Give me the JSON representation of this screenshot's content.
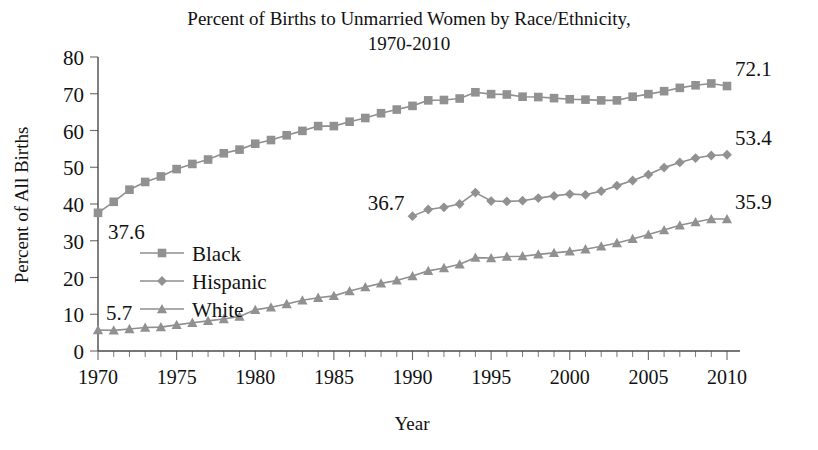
{
  "chart_data": {
    "type": "line",
    "title": "Percent of Births to Unmarried Women by Race/Ethnicity,",
    "title_line2": "1970-2010",
    "xlabel": "Year",
    "ylabel": "Percent of All Births",
    "xlim": [
      1970,
      2010
    ],
    "ylim": [
      0,
      80
    ],
    "ytick_step": 10,
    "xtick_step": 5,
    "xtick_minor_step": 1,
    "grid": false,
    "legend_position": "inside-left",
    "yticks": [
      "0",
      "10",
      "20",
      "30",
      "40",
      "50",
      "60",
      "70",
      "80"
    ],
    "xticks": [
      "1970",
      "1975",
      "1980",
      "1985",
      "1990",
      "1995",
      "2000",
      "2005",
      "2010"
    ],
    "series": [
      {
        "name": "Black",
        "marker": "square",
        "color": "#919191",
        "x": [
          1970,
          1971,
          1972,
          1973,
          1974,
          1975,
          1976,
          1977,
          1978,
          1979,
          1980,
          1981,
          1982,
          1983,
          1984,
          1985,
          1986,
          1987,
          1988,
          1989,
          1990,
          1991,
          1992,
          1993,
          1994,
          1995,
          1996,
          1997,
          1998,
          1999,
          2000,
          2001,
          2002,
          2003,
          2004,
          2005,
          2006,
          2007,
          2008,
          2009,
          2010
        ],
        "values": [
          37.6,
          40.6,
          43.9,
          46.0,
          47.5,
          49.5,
          50.9,
          52.1,
          53.8,
          54.8,
          56.4,
          57.4,
          58.7,
          59.9,
          61.2,
          61.2,
          62.4,
          63.4,
          64.7,
          65.7,
          66.7,
          68.2,
          68.3,
          68.7,
          70.4,
          69.9,
          69.8,
          69.2,
          69.1,
          68.8,
          68.5,
          68.4,
          68.2,
          68.2,
          69.2,
          69.9,
          70.7,
          71.6,
          72.3,
          72.8,
          72.1
        ],
        "start_label": "37.6",
        "end_label": "72.1"
      },
      {
        "name": "Hispanic",
        "marker": "diamond",
        "color": "#919191",
        "x": [
          1990,
          1991,
          1992,
          1993,
          1994,
          1995,
          1996,
          1997,
          1998,
          1999,
          2000,
          2001,
          2002,
          2003,
          2004,
          2005,
          2006,
          2007,
          2008,
          2009,
          2010
        ],
        "values": [
          36.7,
          38.5,
          39.1,
          40.0,
          43.1,
          40.8,
          40.7,
          40.9,
          41.6,
          42.2,
          42.7,
          42.5,
          43.5,
          45.0,
          46.4,
          48.0,
          49.9,
          51.3,
          52.5,
          53.2,
          53.4
        ],
        "start_label": "36.7",
        "end_label": "53.4"
      },
      {
        "name": "White",
        "marker": "triangle",
        "color": "#919191",
        "x": [
          1970,
          1971,
          1972,
          1973,
          1974,
          1975,
          1976,
          1977,
          1978,
          1979,
          1980,
          1981,
          1982,
          1983,
          1984,
          1985,
          1986,
          1987,
          1988,
          1989,
          1990,
          1991,
          1992,
          1993,
          1994,
          1995,
          1996,
          1997,
          1998,
          1999,
          2000,
          2001,
          2002,
          2003,
          2004,
          2005,
          2006,
          2007,
          2008,
          2009,
          2010
        ],
        "values": [
          5.7,
          5.6,
          6.0,
          6.4,
          6.5,
          7.1,
          7.7,
          8.2,
          8.7,
          9.4,
          11.2,
          11.9,
          12.8,
          13.8,
          14.5,
          15.0,
          16.3,
          17.4,
          18.4,
          19.2,
          20.4,
          21.8,
          22.6,
          23.6,
          25.4,
          25.3,
          25.7,
          25.8,
          26.3,
          26.7,
          27.1,
          27.7,
          28.5,
          29.4,
          30.5,
          31.7,
          32.9,
          34.2,
          35.1,
          35.9,
          35.9
        ],
        "start_label": "5.7",
        "end_label": "35.9"
      }
    ],
    "annotations": [
      {
        "text": "37.6",
        "series": "Black",
        "x": 1970,
        "y": 37.6,
        "placement": "below-right"
      },
      {
        "text": "72.1",
        "series": "Black",
        "x": 2010,
        "y": 72.1,
        "placement": "above-right"
      },
      {
        "text": "36.7",
        "series": "Hispanic",
        "x": 1990,
        "y": 36.7,
        "placement": "above-left"
      },
      {
        "text": "53.4",
        "series": "Hispanic",
        "x": 2010,
        "y": 53.4,
        "placement": "above-right"
      },
      {
        "text": "5.7",
        "series": "White",
        "x": 1970,
        "y": 5.7,
        "placement": "above-right"
      },
      {
        "text": "35.9",
        "series": "White",
        "x": 2010,
        "y": 35.9,
        "placement": "above-right"
      }
    ],
    "legend": [
      {
        "label": "Black",
        "marker": "square"
      },
      {
        "label": "Hispanic",
        "marker": "diamond"
      },
      {
        "label": "White",
        "marker": "triangle"
      }
    ]
  },
  "colors": {
    "series_gray": "#919191",
    "axis": "#4a4a4a",
    "text": "#111111",
    "background": "#ffffff"
  }
}
